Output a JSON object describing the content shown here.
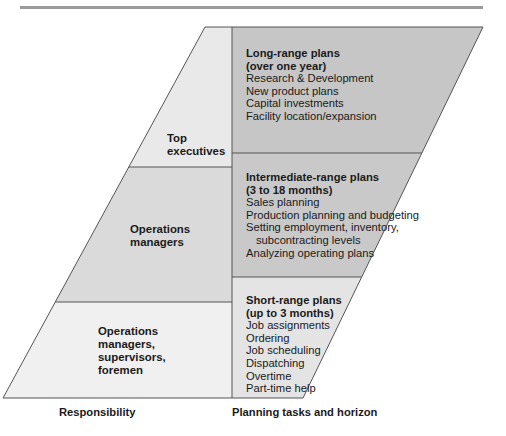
{
  "colors": {
    "top_rule": "#9a9a9a",
    "long_range_fill": "#c6c6c6",
    "intermediate_fill": "#c9c9c9",
    "short_range_fill": "#e4e4e4",
    "top_exec_fill": "#e9e9e9",
    "ops_managers_fill": "#dadada",
    "supervisors_fill": "#f0f0f0",
    "border": "#555555"
  },
  "responsibility": {
    "top": "Top executives",
    "top_lines": [
      "Top",
      "executives"
    ],
    "middle": "Operations managers",
    "middle_lines": [
      "Operations",
      "managers"
    ],
    "bottom": "Operations managers, supervisors, foremen",
    "bottom_lines": [
      "Operations",
      "managers,",
      "supervisors,",
      "foremen"
    ]
  },
  "plans": {
    "long": {
      "title_lines": [
        "Long-range plans",
        "(over one year)"
      ],
      "items": [
        "Research & Development",
        "New product plans",
        "Capital investments",
        "Facility location/expansion"
      ]
    },
    "intermediate": {
      "title_lines": [
        "Intermediate-range plans",
        "(3 to 18 months)"
      ],
      "items": [
        "Sales planning",
        "Production planning and budgeting",
        "Setting employment, inventory,",
        "subcontracting levels",
        "Analyzing operating plans"
      ]
    },
    "short": {
      "title_lines": [
        "Short-range plans",
        "(up to 3 months)"
      ],
      "items": [
        "Job assignments",
        "Ordering",
        "Job scheduling",
        "Dispatching",
        "Overtime",
        "Part-time help"
      ]
    }
  },
  "axis_labels": {
    "left": "Responsibility",
    "right": "Planning tasks and horizon"
  }
}
